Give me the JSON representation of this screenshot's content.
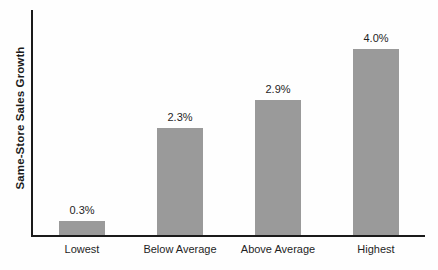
{
  "chart_data": {
    "type": "bar",
    "title": "",
    "subtitle": "",
    "xlabel": "",
    "ylabel": "Same-Store Sales Growth",
    "categories": [
      "Lowest",
      "Below Average",
      "Above Average",
      "Highest"
    ],
    "values": [
      0.3,
      2.3,
      2.9,
      4.0
    ],
    "value_labels": [
      "0.3%",
      "2.3%",
      "2.9%",
      "4.0%"
    ],
    "ylim": [
      0,
      4.85
    ],
    "grid": false,
    "legend": "none",
    "units": "percent",
    "series": [
      {
        "name": "Same-Store Sales Growth",
        "values": [
          0.3,
          2.3,
          2.9,
          4.0
        ]
      }
    ],
    "colors": {
      "bar_fill": "#9a9a9a",
      "axis": "#1a1a1a",
      "text": "#1f1f1f",
      "background": "#fefefe"
    }
  }
}
